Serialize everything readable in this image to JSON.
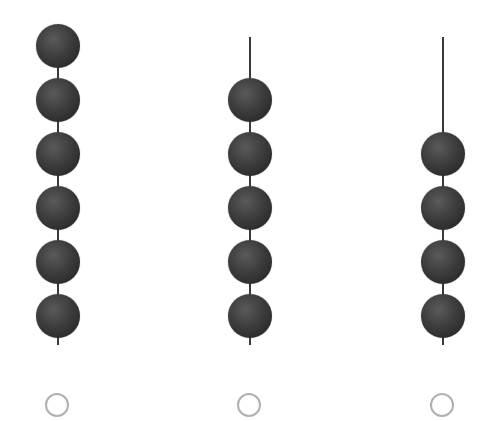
{
  "options": [
    {
      "id": "option-a",
      "bead_count": 6,
      "selected": false
    },
    {
      "id": "option-b",
      "bead_count": 5,
      "selected": false
    },
    {
      "id": "option-c",
      "bead_count": 4,
      "selected": false
    }
  ],
  "colors": {
    "bead": "#3d3d3d",
    "rod": "#3a3a3a",
    "radio_border": "#b0b0b0"
  }
}
